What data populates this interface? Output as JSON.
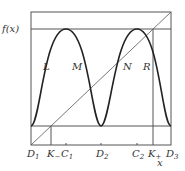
{
  "diagram": {
    "y_axis_label": "f(x)",
    "x_axis_label": "x",
    "curve_labels": [
      "L",
      "M",
      "N",
      "R"
    ],
    "x_ticks": [
      {
        "main": "D",
        "sub": "1"
      },
      {
        "main": "K",
        "sub": "−"
      },
      {
        "main": "C",
        "sub": "1"
      },
      {
        "main": "D",
        "sub": "2"
      },
      {
        "main": "C",
        "sub": "2"
      },
      {
        "main": "K",
        "sub": "+"
      },
      {
        "main": "D",
        "sub": "3"
      }
    ],
    "colors": {
      "curve": "#222222",
      "lines": "#555555"
    }
  }
}
